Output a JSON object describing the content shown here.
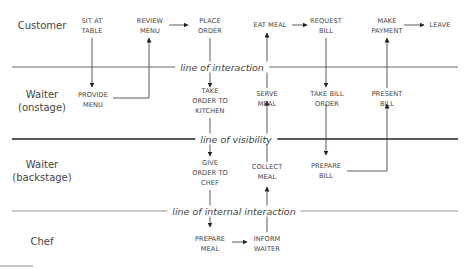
{
  "diagram": {
    "type": "service-blueprint",
    "rows": [
      {
        "id": "customer",
        "label": "Customer"
      },
      {
        "id": "waiter-onstage",
        "label": "Waiter\n(onstage)"
      },
      {
        "id": "waiter-backstage",
        "label": "Waiter\n(backstage)"
      },
      {
        "id": "chef",
        "label": "Chef"
      }
    ],
    "separators": [
      {
        "id": "interaction",
        "label": "line of interaction"
      },
      {
        "id": "visibility",
        "label": "line of visibility"
      },
      {
        "id": "internal",
        "label": "line of internal interaction"
      }
    ],
    "nodes": {
      "sit_at_table": "SIT AT\nTABLE",
      "review_menu": "REVIEW\nMENU",
      "place_order": "PLACE\nORDER",
      "eat_meal": "EAT MEAL",
      "request_bill": "REQUEST\nBILL",
      "make_payment": "MAKE\nPAYMENT",
      "leave": "LEAVE",
      "provide_menu": "PROVIDE\nMENU",
      "take_order_to_kitchen": "TAKE\nORDER TO\nKITCHEN",
      "serve_meal": "SERVE\nMEAL",
      "take_bill_order": "TAKE BILL\nORDER",
      "present_bill": "PRESENT\nBILL",
      "give_order_to_chef": "GIVE\nORDER TO\nCHEF",
      "collect_meal": "COLLECT\nMEAL",
      "prepare_bill": "PREPARE\nBILL",
      "prepare_meal": "PREPARE\nMEAL",
      "inform_waiter": "INFORM\nWAITER"
    },
    "edges": [
      {
        "from": "SIT AT TABLE",
        "to": "PROVIDE MENU"
      },
      {
        "from": "PROVIDE MENU",
        "to": "REVIEW MENU"
      },
      {
        "from": "REVIEW MENU",
        "to": "PLACE ORDER"
      },
      {
        "from": "PLACE ORDER",
        "to": "TAKE ORDER TO KITCHEN"
      },
      {
        "from": "TAKE ORDER TO KITCHEN",
        "to": "GIVE ORDER TO CHEF"
      },
      {
        "from": "GIVE ORDER TO CHEF",
        "to": "PREPARE MEAL"
      },
      {
        "from": "PREPARE MEAL",
        "to": "INFORM WAITER"
      },
      {
        "from": "INFORM WAITER",
        "to": "COLLECT MEAL"
      },
      {
        "from": "COLLECT MEAL",
        "to": "SERVE MEAL"
      },
      {
        "from": "SERVE MEAL",
        "to": "EAT MEAL"
      },
      {
        "from": "EAT MEAL",
        "to": "REQUEST BILL"
      },
      {
        "from": "REQUEST BILL",
        "to": "TAKE BILL ORDER"
      },
      {
        "from": "TAKE BILL ORDER",
        "to": "PREPARE BILL"
      },
      {
        "from": "PREPARE BILL",
        "to": "PRESENT BILL"
      },
      {
        "from": "PRESENT BILL",
        "to": "MAKE PAYMENT"
      },
      {
        "from": "MAKE PAYMENT",
        "to": "LEAVE"
      }
    ]
  }
}
